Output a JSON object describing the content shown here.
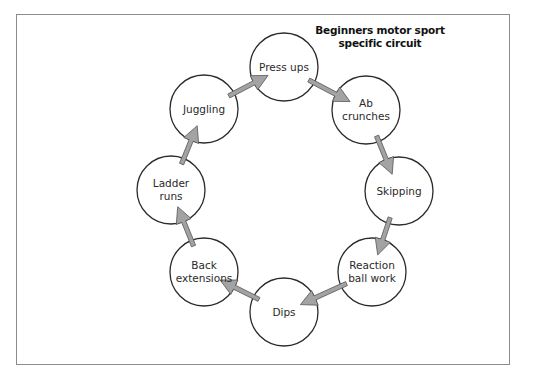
{
  "diagram": {
    "title_line1": "Beginners motor sport",
    "title_line2": "specific circuit",
    "colors": {
      "circle_stroke": "#2b2b2b",
      "arrow_fill": "#a3a3a3",
      "arrow_stroke": "#555555",
      "frame_border": "#8c8c8c"
    },
    "nodes": [
      {
        "id": "press-ups",
        "line1": "Press ups",
        "line2": "",
        "cx": 284,
        "cy": 67
      },
      {
        "id": "ab-crunches",
        "line1": "Ab",
        "line2": "crunches",
        "cx": 366,
        "cy": 110
      },
      {
        "id": "skipping",
        "line1": "Skipping",
        "line2": "",
        "cx": 399,
        "cy": 191
      },
      {
        "id": "reaction-ball-work",
        "line1": "Reaction",
        "line2": "ball work",
        "cx": 372,
        "cy": 272
      },
      {
        "id": "dips",
        "line1": "Dips",
        "line2": "",
        "cx": 284,
        "cy": 312
      },
      {
        "id": "back-extensions",
        "line1": "Back",
        "line2": "extensions",
        "cx": 204,
        "cy": 272
      },
      {
        "id": "ladder-runs",
        "line1": "Ladder",
        "line2": "runs",
        "cx": 171,
        "cy": 190
      },
      {
        "id": "juggling",
        "line1": "Juggling",
        "line2": "",
        "cx": 204,
        "cy": 109
      }
    ],
    "edges": [
      {
        "from": "juggling",
        "to": "press-ups"
      },
      {
        "from": "press-ups",
        "to": "ab-crunches"
      },
      {
        "from": "ab-crunches",
        "to": "skipping"
      },
      {
        "from": "skipping",
        "to": "reaction-ball-work"
      },
      {
        "from": "reaction-ball-work",
        "to": "dips"
      },
      {
        "from": "dips",
        "to": "back-extensions"
      },
      {
        "from": "back-extensions",
        "to": "ladder-runs"
      },
      {
        "from": "ladder-runs",
        "to": "juggling"
      }
    ]
  }
}
